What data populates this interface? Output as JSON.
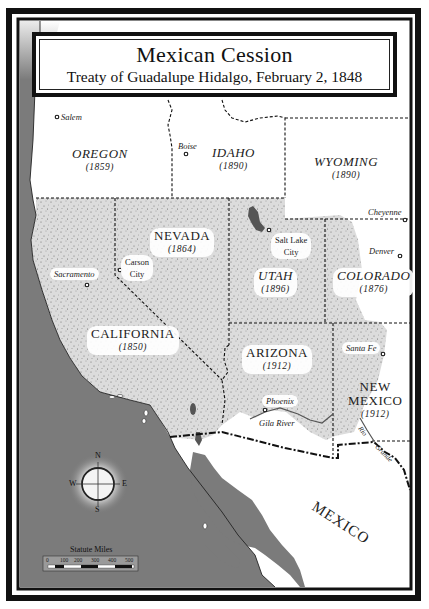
{
  "title": {
    "main": "Mexican Cession",
    "sub": "Treaty of Guadalupe Hidalgo, February 2, 1848"
  },
  "states": {
    "oregon": {
      "name": "OREGON",
      "year": "(1859)"
    },
    "idaho": {
      "name": "IDAHO",
      "year": "(1890)"
    },
    "wyoming": {
      "name": "WYOMING",
      "year": "(1890)"
    },
    "nevada": {
      "name": "NEVADA",
      "year": "(1864)"
    },
    "utah": {
      "name": "UTAH",
      "year": "(1896)"
    },
    "colorado": {
      "name": "COLORADO",
      "year": "(1876)"
    },
    "california": {
      "name": "CALIFORNIA",
      "year": "(1850)"
    },
    "arizona": {
      "name": "ARIZONA",
      "year": "(1912)"
    },
    "new_mexico": {
      "name_line1": "NEW",
      "name_line2": "MEXICO",
      "year": "(1912)"
    }
  },
  "cities": {
    "salem": "Salem",
    "boise": "Boise",
    "cheyenne": "Cheyenne",
    "denver": "Denver",
    "salt_lake_line1": "Salt Lake",
    "salt_lake_line2": "City",
    "carson_line1": "Carson",
    "carson_line2": "City",
    "sacramento": "Sacramento",
    "santa_fe": "Santa Fe",
    "phoenix": "Phoenix"
  },
  "rivers": {
    "gila": "Gila River",
    "rio_grande_1": "Rio",
    "rio_grande_2": "Grande"
  },
  "country": "MEXICO",
  "compass": {
    "n": "N",
    "s": "S",
    "e": "E",
    "w": "W"
  },
  "scale": {
    "title": "Statute Miles",
    "ticks": [
      "0",
      "100",
      "200",
      "300",
      "400",
      "500"
    ]
  },
  "colors": {
    "ocean": "#7a7a7a",
    "cession": "#d9d9d9",
    "land": "#ffffff",
    "border": "#111111"
  }
}
